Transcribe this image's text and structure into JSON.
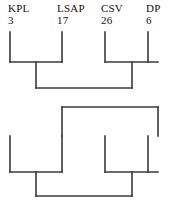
{
  "diagram": {
    "type": "bracket-dendrogram",
    "line_color": "#3a3a3a",
    "text_color": "#111111",
    "background": "#ffffff",
    "leaves": [
      {
        "name": "KPL",
        "value": "3",
        "x": 10
      },
      {
        "name": "LSAP",
        "value": "17",
        "x": 62
      },
      {
        "name": "CSV",
        "value": "26",
        "x": 105
      },
      {
        "name": "DP",
        "value": "6",
        "x": 148
      }
    ],
    "labels": {
      "leaf_1_name": "KPL",
      "leaf_1_value": "3",
      "leaf_2_name": "LSAP",
      "leaf_2_value": "17",
      "leaf_3_name": "CSV",
      "leaf_3_value": "26",
      "leaf_4_name": "DP",
      "leaf_4_value": "6"
    },
    "upper_structure": {
      "stem_tops_y": 32,
      "bracket1_y": 62,
      "bracket1_x1": 10,
      "bracket1_x2": 62,
      "bracket1_mid": 36,
      "bracket2_y": 62,
      "bracket2_x1": 105,
      "bracket2_x2": 158,
      "bracket2_mid": 132,
      "join_y": 88,
      "join_x1": 36,
      "join_x2": 132
    },
    "lower_structure": {
      "bracket_top_y": 107,
      "bracket_top_x1": 62,
      "bracket_top_x2": 158,
      "stem_tops_y": 136,
      "bracket3_y": 172,
      "bracket3_x1": 10,
      "bracket3_x2": 62,
      "bracket3_mid": 36,
      "bracket4_y": 172,
      "bracket4_x1": 105,
      "bracket4_x2": 158,
      "bracket4_mid": 132,
      "join_y": 196,
      "join_x1": 36,
      "join_x2": 132
    }
  }
}
